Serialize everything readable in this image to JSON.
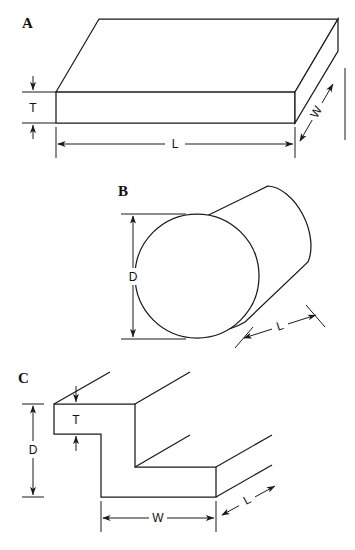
{
  "figure": {
    "background_color": "#ffffff",
    "line_color": "#1a1a1a",
    "panels": [
      {
        "id": "A",
        "label": "A",
        "shape": "rectangular-slab",
        "description": "Flat rectangular plate shown in isometric view with hidden edges dashed",
        "dimensions": [
          {
            "symbol": "T",
            "name": "thickness",
            "orientation": "vertical",
            "location": "left"
          },
          {
            "symbol": "L",
            "name": "length",
            "orientation": "horizontal",
            "location": "bottom"
          },
          {
            "symbol": "W",
            "name": "width",
            "orientation": "diagonal",
            "location": "right"
          }
        ]
      },
      {
        "id": "B",
        "label": "B",
        "shape": "cylinder",
        "description": "Circular cylinder rod shown at an angle with front circular face",
        "dimensions": [
          {
            "symbol": "D",
            "name": "diameter",
            "orientation": "vertical",
            "location": "left"
          },
          {
            "symbol": "L",
            "name": "length",
            "orientation": "diagonal",
            "location": "bottom-right"
          }
        ]
      },
      {
        "id": "C",
        "label": "C",
        "shape": "stepped-z-profile",
        "description": "Z-shaped stepped bar profile shown in isometric view",
        "dimensions": [
          {
            "symbol": "T",
            "name": "thickness",
            "orientation": "vertical",
            "location": "upper-left"
          },
          {
            "symbol": "D",
            "name": "depth",
            "orientation": "vertical",
            "location": "left"
          },
          {
            "symbol": "W",
            "name": "width",
            "orientation": "horizontal",
            "location": "bottom"
          },
          {
            "symbol": "L",
            "name": "length",
            "orientation": "diagonal",
            "location": "bottom-right"
          }
        ]
      }
    ]
  },
  "labels": {
    "panel_a": "A",
    "panel_b": "B",
    "panel_c": "C",
    "a_thickness": "T",
    "a_length": "L",
    "a_width": "W",
    "b_diameter": "D",
    "b_length": "L",
    "c_thickness": "T",
    "c_depth": "D",
    "c_width": "W",
    "c_length": "L"
  }
}
